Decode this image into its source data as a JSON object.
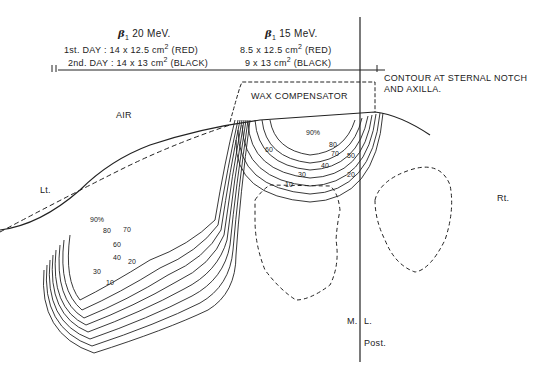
{
  "beams": [
    {
      "title": "20 MeV.",
      "symbol": "β",
      "symbol_sub": "1",
      "day1": {
        "prefix": "1st. DAY : 14 x 12.5 cm",
        "sup": "2",
        "suffix": " (RED)"
      },
      "day2": {
        "prefix": "2nd. DAY : 14 x 13 cm",
        "sup": "2",
        "suffix": " (BLACK)"
      }
    },
    {
      "title": "15 MeV.",
      "symbol": "β",
      "symbol_sub": "1",
      "day1": {
        "prefix": "8.5 x 12.5 cm",
        "sup": "2",
        "suffix": " (RED)"
      },
      "day2": {
        "prefix": "9 x 13 cm",
        "sup": "2",
        "suffix": " (BLACK)"
      }
    }
  ],
  "labels": {
    "contour_line1": "CONTOUR AT STERNAL NOTCH",
    "contour_line2": "AND AXILLA.",
    "wax": "WAX COMPENSATOR",
    "air": "AIR",
    "left": "Lt.",
    "right": "Rt.",
    "midline_m": "M.",
    "midline_l": "L.",
    "posterior": "Post."
  },
  "isodose_labels_left": [
    "90%",
    "80",
    "70",
    "60",
    "50",
    "40",
    "30",
    "20",
    "10"
  ],
  "isodose_labels_center": [
    "90%",
    "80",
    "70",
    "60",
    "50",
    "40",
    "30",
    "20",
    "10"
  ],
  "colors": {
    "ink": "#222222",
    "background": "#ffffff"
  }
}
